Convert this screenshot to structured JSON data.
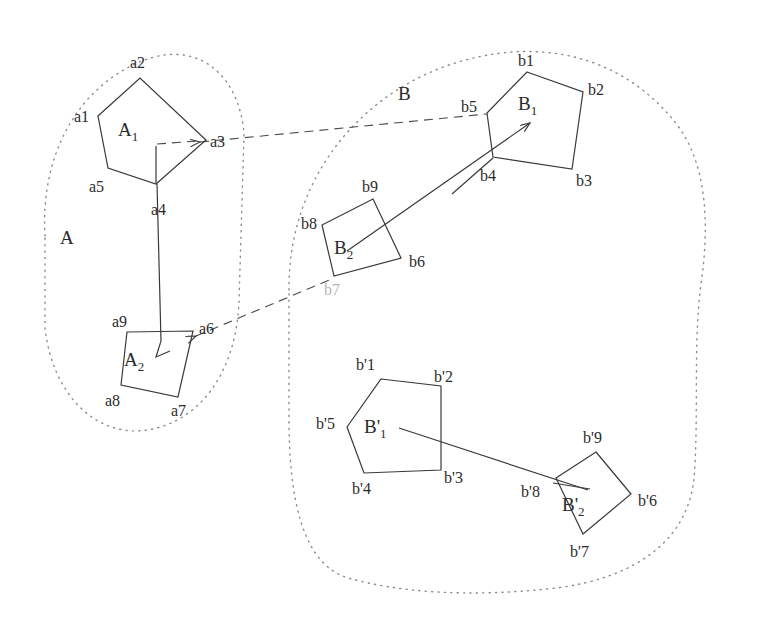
{
  "figure": {
    "type": "set-correspondence-diagram",
    "background_color": "#ffffff",
    "stroke_color": "#3a3a3a",
    "boundary_color": "#8a8a8a"
  },
  "sets": {
    "A": {
      "label": "A",
      "x": 60,
      "y": 238,
      "boundary_style": "dotted"
    },
    "B": {
      "label": "B",
      "x": 400,
      "y": 94,
      "boundary_style": "dotted"
    }
  },
  "polygons": {
    "A1": {
      "label": "A",
      "subscript": "1",
      "label_x": 122,
      "label_y": 132,
      "sides": 5,
      "vertices": [
        {
          "name": "a1",
          "x": 98,
          "y": 116,
          "label_x": 74,
          "label_y": 122
        },
        {
          "name": "a2",
          "x": 140,
          "y": 78,
          "label_x": 132,
          "label_y": 68
        },
        {
          "name": "a3",
          "x": 206,
          "y": 140,
          "label_x": 212,
          "label_y": 146
        },
        {
          "name": "a4",
          "x": 156,
          "y": 184,
          "label_x": 152,
          "label_y": 213
        },
        {
          "name": "a5",
          "x": 108,
          "y": 168,
          "label_x": 92,
          "label_y": 190
        }
      ]
    },
    "A2": {
      "label": "A",
      "subscript": "2",
      "label_x": 128,
      "label_y": 362,
      "sides": 4,
      "vertices": [
        {
          "name": "a6",
          "x": 193,
          "y": 331,
          "label_x": 200,
          "label_y": 332
        },
        {
          "name": "a7",
          "x": 178,
          "y": 397,
          "label_x": 174,
          "label_y": 415
        },
        {
          "name": "a8",
          "x": 121,
          "y": 385,
          "label_x": 107,
          "label_y": 405
        },
        {
          "name": "a9",
          "x": 127,
          "y": 332,
          "label_x": 114,
          "label_y": 325
        }
      ]
    },
    "B1": {
      "label": "B",
      "subscript": "1",
      "label_x": 523,
      "label_y": 105,
      "sides": 5,
      "vertices": [
        {
          "name": "b1",
          "x": 527,
          "y": 72,
          "label_x": 519,
          "label_y": 64
        },
        {
          "name": "b2",
          "x": 583,
          "y": 92,
          "label_x": 589,
          "label_y": 93
        },
        {
          "name": "b3",
          "x": 572,
          "y": 169,
          "label_x": 578,
          "label_y": 184
        },
        {
          "name": "b4",
          "x": 493,
          "y": 157,
          "label_x": 484,
          "label_y": 180
        },
        {
          "name": "b5",
          "x": 487,
          "y": 113,
          "label_x": 464,
          "label_y": 110
        }
      ]
    },
    "B2": {
      "label": "B",
      "subscript": "2",
      "label_x": 340,
      "label_y": 250,
      "sides": 4,
      "vertices": [
        {
          "name": "b6",
          "x": 401,
          "y": 258,
          "label_x": 411,
          "label_y": 265
        },
        {
          "name": "b7",
          "x": 334,
          "y": 276,
          "label_x": 326,
          "label_y": 292
        },
        {
          "name": "b8",
          "x": 322,
          "y": 225,
          "label_x": 304,
          "label_y": 226
        },
        {
          "name": "b9",
          "x": 373,
          "y": 199,
          "label_x": 365,
          "label_y": 190
        }
      ]
    },
    "Bp1": {
      "label": "B'",
      "subscript": "1",
      "label_x": 371,
      "label_y": 428,
      "sides": 5,
      "vertices": [
        {
          "name": "b'1",
          "x": 381,
          "y": 379,
          "label_x": 360,
          "label_y": 367
        },
        {
          "name": "b'2",
          "x": 441,
          "y": 386,
          "label_x": 438,
          "label_y": 379
        },
        {
          "name": "b'3",
          "x": 441,
          "y": 470,
          "label_x": 447,
          "label_y": 481
        },
        {
          "name": "b'4",
          "x": 364,
          "y": 473,
          "label_x": 355,
          "label_y": 492
        },
        {
          "name": "b'5",
          "x": 347,
          "y": 427,
          "label_x": 320,
          "label_y": 425
        }
      ]
    },
    "Bp2": {
      "label": "B'",
      "subscript": "2",
      "label_x": 568,
      "label_y": 506,
      "sides": 4,
      "vertices": [
        {
          "name": "b'6",
          "x": 631,
          "y": 494,
          "label_x": 640,
          "label_y": 503
        },
        {
          "name": "b'7",
          "x": 583,
          "y": 534,
          "label_x": 573,
          "label_y": 555
        },
        {
          "name": "b'8",
          "x": 556,
          "y": 478,
          "label_x": 525,
          "label_y": 495
        },
        {
          "name": "b'9",
          "x": 596,
          "y": 452,
          "label_x": 586,
          "label_y": 440
        }
      ]
    }
  },
  "connectors": {
    "solid": [
      {
        "name": "a4-to-a6-stem",
        "points": "156,184 160,340 156,357 170,350",
        "arrow": false
      },
      {
        "name": "b2-to-b1-internal",
        "points": "493,157 530,123",
        "arrow": true
      },
      {
        "name": "b2-center-to-b1",
        "points": "349,250 530,123",
        "arrow": true
      },
      {
        "name": "bp1-to-bp2",
        "points": "400,429 586,489",
        "arrow": false
      }
    ],
    "dashed": [
      {
        "name": "a3-to-b5-dashed",
        "points": "153,144 206,140 487,113",
        "arrow": true,
        "arrow_at": "a3"
      },
      {
        "name": "a6-to-b7-dashed",
        "points": "334,276 193,336",
        "arrow": true,
        "arrow_at": "a6"
      }
    ]
  },
  "boundaries": {
    "A": {
      "path": "M 44,232 C 40,150 78,88 140,62 C 196,40 238,76 243,132 L 238,300 C 235,370 200,420 148,428 C 96,436 54,392 46,330 Z"
    },
    "B_outer": {
      "path": "M 288,284 C 286,176 350,98 444,66 C 540,34 624,62 676,126 C 704,162 710,220 702,282 C 694,344 698,420 694,480 C 690,540 640,580 560,588 C 470,596 400,592 350,580 C 300,568 288,500 288,420 Z"
    }
  },
  "labels": {
    "faint_b7": "b7"
  }
}
